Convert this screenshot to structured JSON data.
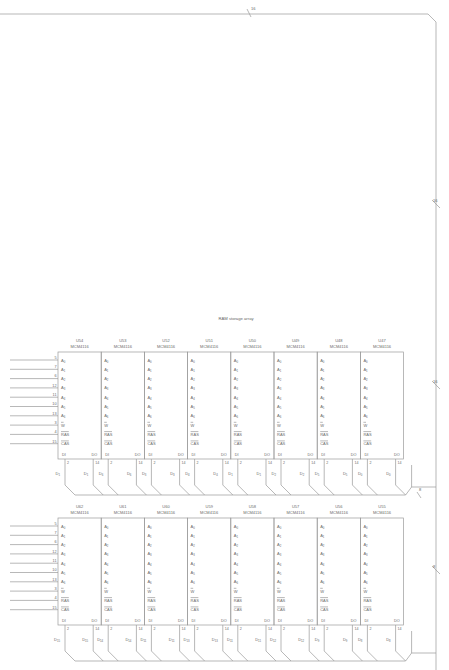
{
  "title": "RAM storage array",
  "bus_labels": {
    "top": "16",
    "right_upper": "16",
    "right_middle": "16",
    "right_lower": "8",
    "row1_output": "8"
  },
  "pin_rows": [
    {
      "num": "5",
      "name": "A0",
      "main": "A",
      "sub": "0"
    },
    {
      "num": "7",
      "name": "A1",
      "main": "A",
      "sub": "1"
    },
    {
      "num": "6",
      "name": "A2",
      "main": "A",
      "sub": "2"
    },
    {
      "num": "12",
      "name": "A3",
      "main": "A",
      "sub": "3"
    },
    {
      "num": "11",
      "name": "A4",
      "main": "A",
      "sub": "4"
    },
    {
      "num": "10",
      "name": "A5",
      "main": "A",
      "sub": "5"
    },
    {
      "num": "13",
      "name": "A6",
      "main": "A",
      "sub": "6"
    },
    {
      "num": "3",
      "name": "W",
      "main": "W",
      "sub": "",
      "overbar": true
    },
    {
      "num": "4",
      "name": "RAS",
      "main": "RAS",
      "sub": "",
      "overbar": true
    },
    {
      "num": "15",
      "name": "CAS",
      "main": "CAS",
      "sub": "",
      "overbar": true
    }
  ],
  "data_pins": {
    "di_label": "DI",
    "do_label": "DO",
    "di_num": "2",
    "do_num": "14"
  },
  "rows": [
    {
      "chips": [
        {
          "ref": "U54",
          "part": "MCM4116",
          "di": "1",
          "do": "1"
        },
        {
          "ref": "U53",
          "part": "MCM4116",
          "di": "6",
          "do": "6"
        },
        {
          "ref": "U52",
          "part": "MCM4116",
          "di": "3",
          "do": "3"
        },
        {
          "ref": "U51",
          "part": "MCM4116",
          "di": "4",
          "do": "4"
        },
        {
          "ref": "U50",
          "part": "MCM4116",
          "di": "1",
          "do": "1"
        },
        {
          "ref": "U49",
          "part": "MCM4116",
          "di": "2",
          "do": "2"
        },
        {
          "ref": "U48",
          "part": "MCM4116",
          "di": "5",
          "do": "5"
        },
        {
          "ref": "U47",
          "part": "MCM4116",
          "di": "0",
          "do": "0"
        }
      ]
    },
    {
      "chips": [
        {
          "ref": "U62",
          "part": "MCM4116",
          "di": "15",
          "do": "15"
        },
        {
          "ref": "U61",
          "part": "MCM4116",
          "di": "14",
          "do": "14"
        },
        {
          "ref": "U60",
          "part": "MCM4116",
          "di": "11",
          "do": "11"
        },
        {
          "ref": "U59",
          "part": "MCM4116",
          "di": "13",
          "do": "13"
        },
        {
          "ref": "U58",
          "part": "MCM4116",
          "di": "11",
          "do": "11"
        },
        {
          "ref": "U57",
          "part": "MCM4116",
          "di": "12",
          "do": "12"
        },
        {
          "ref": "U56",
          "part": "MCM4116",
          "di": "9",
          "do": "9"
        },
        {
          "ref": "U55",
          "part": "MCM4116",
          "di": "8",
          "do": "8"
        }
      ]
    }
  ],
  "colors": {
    "line": "#9a9a9a",
    "text": "#6a6a6a",
    "background": "#ffffff"
  }
}
